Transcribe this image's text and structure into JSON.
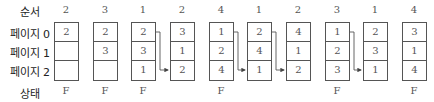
{
  "labels": {
    "sequence": "순서",
    "page0": "페이지 0",
    "page1": "페이지 1",
    "page2": "페이지 2",
    "status": "상태"
  },
  "columns": [
    {
      "ref": "2",
      "frames": [
        "2",
        "",
        ""
      ],
      "status": "F"
    },
    {
      "ref": "3",
      "frames": [
        "2",
        "3",
        ""
      ],
      "status": "F"
    },
    {
      "ref": "1",
      "frames": [
        "2",
        "3",
        "1"
      ],
      "status": "F"
    },
    {
      "ref": "2",
      "frames": [
        "3",
        "1",
        "2"
      ],
      "status": ""
    },
    {
      "ref": "4",
      "frames": [
        "1",
        "2",
        "4"
      ],
      "status": "F"
    },
    {
      "ref": "1",
      "frames": [
        "2",
        "4",
        "1"
      ],
      "status": ""
    },
    {
      "ref": "2",
      "frames": [
        "4",
        "1",
        "2"
      ],
      "status": ""
    },
    {
      "ref": "3",
      "frames": [
        "1",
        "2",
        "3"
      ],
      "status": "F"
    },
    {
      "ref": "1",
      "frames": [
        "2",
        "3",
        "1"
      ],
      "status": ""
    },
    {
      "ref": "4",
      "frames": [
        "3",
        "1",
        "4"
      ],
      "status": "F"
    }
  ],
  "arrows": [
    {
      "from": 2,
      "to": 3
    },
    {
      "from": 4,
      "to": 5
    },
    {
      "from": 5,
      "to": 6
    },
    {
      "from": 7,
      "to": 8
    }
  ],
  "colors": {
    "line": "#555555",
    "text": "#555555"
  }
}
